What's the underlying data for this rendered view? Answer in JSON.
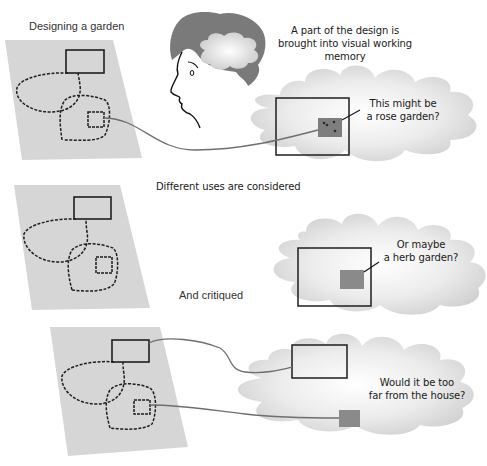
{
  "title": "Designing a garden",
  "colors": {
    "paper": "#d6d6d6",
    "cloud_light": "#f6f6f6",
    "cloud_dark": "#cfcfcf",
    "highlight_box": "#8a8a8a",
    "line": "#6e6e6e",
    "sketch": "#1e1e1e",
    "hair": "#6a6a6a"
  },
  "panels": [
    {
      "id": "panel-1",
      "caption": "Designing a garden",
      "annotation_lines": [
        "A part of the design is",
        "brought into visual working",
        "memory"
      ],
      "thought_lines": [
        "This might be",
        "a rose garden?"
      ]
    },
    {
      "id": "panel-2",
      "caption": "Different uses are considered",
      "thought_lines": [
        "Or maybe",
        "a herb garden?"
      ]
    },
    {
      "id": "panel-3",
      "caption": "And critiqued",
      "thought_lines": [
        "Would it be too",
        "far from the house?"
      ]
    }
  ],
  "icons": {
    "head": "person-head-profile-icon",
    "brain_cloud": "thought-cloud-icon"
  }
}
